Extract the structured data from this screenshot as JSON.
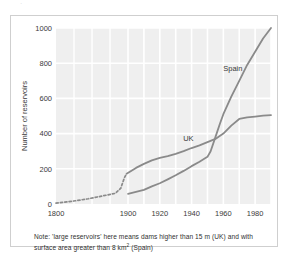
{
  "figure": {
    "scan_artifact": "·",
    "note_prefix": "Note: 'large reservoirs' here means dams higher than 15 m (UK) and with surface area greater than 8 km",
    "note_superscript": "2",
    "note_suffix": " (Spain)",
    "note_full": "Note: 'large reservoirs' here means dams higher than 15 m (UK) and with surface area greater than 8 km2 (Spain)"
  },
  "colors": {
    "panel": "#efefef",
    "gridline": "#ffffff",
    "series_line": "#8a8a8a",
    "frame": "#cfcfcf",
    "text": "#2b2b2b"
  },
  "chart_data": {
    "type": "line",
    "title": "",
    "xlabel": "",
    "ylabel": "Number of reservoirs",
    "xlim": [
      1800,
      1990
    ],
    "ylim": [
      0,
      1000
    ],
    "grid": true,
    "legend": "inline-labels",
    "x_broken_axis": true,
    "x_ticks": [
      1800,
      1900,
      1920,
      1940,
      1960,
      1980
    ],
    "x_tick_labels": [
      "1800",
      "1900",
      "1920",
      "1940",
      "1960",
      "1980"
    ],
    "y_ticks": [
      0,
      200,
      400,
      600,
      800,
      1000
    ],
    "y_tick_labels": [
      "0",
      "200",
      "400",
      "600",
      "800",
      "1000"
    ],
    "annotations": [
      {
        "text": "UK",
        "x": 1938,
        "y": 360
      },
      {
        "text": "Spain",
        "x": 1966,
        "y": 755
      }
    ],
    "series": [
      {
        "name": "UK",
        "style": "dashed-then-solid",
        "label": "UK",
        "dashed_points": [
          {
            "x": 1800,
            "y": 5
          },
          {
            "x": 1815,
            "y": 12
          },
          {
            "x": 1830,
            "y": 20
          },
          {
            "x": 1845,
            "y": 30
          },
          {
            "x": 1860,
            "y": 42
          },
          {
            "x": 1872,
            "y": 52
          },
          {
            "x": 1882,
            "y": 60
          },
          {
            "x": 1890,
            "y": 90
          },
          {
            "x": 1895,
            "y": 150
          },
          {
            "x": 1898,
            "y": 172
          }
        ],
        "solid_points": [
          {
            "x": 1898,
            "y": 172
          },
          {
            "x": 1905,
            "y": 205
          },
          {
            "x": 1910,
            "y": 228
          },
          {
            "x": 1915,
            "y": 248
          },
          {
            "x": 1920,
            "y": 262
          },
          {
            "x": 1925,
            "y": 272
          },
          {
            "x": 1930,
            "y": 285
          },
          {
            "x": 1935,
            "y": 300
          },
          {
            "x": 1940,
            "y": 318
          },
          {
            "x": 1945,
            "y": 333
          },
          {
            "x": 1950,
            "y": 352
          },
          {
            "x": 1955,
            "y": 370
          },
          {
            "x": 1960,
            "y": 400
          },
          {
            "x": 1965,
            "y": 445
          },
          {
            "x": 1970,
            "y": 483
          },
          {
            "x": 1975,
            "y": 492
          },
          {
            "x": 1980,
            "y": 497
          },
          {
            "x": 1985,
            "y": 502
          },
          {
            "x": 1990,
            "y": 505
          }
        ]
      },
      {
        "name": "Spain",
        "style": "solid",
        "label": "Spain",
        "solid_points": [
          {
            "x": 1900,
            "y": 58
          },
          {
            "x": 1910,
            "y": 80
          },
          {
            "x": 1915,
            "y": 100
          },
          {
            "x": 1920,
            "y": 118
          },
          {
            "x": 1925,
            "y": 140
          },
          {
            "x": 1930,
            "y": 163
          },
          {
            "x": 1935,
            "y": 188
          },
          {
            "x": 1940,
            "y": 215
          },
          {
            "x": 1945,
            "y": 240
          },
          {
            "x": 1950,
            "y": 268
          },
          {
            "x": 1952,
            "y": 300
          },
          {
            "x": 1955,
            "y": 380
          },
          {
            "x": 1958,
            "y": 460
          },
          {
            "x": 1960,
            "y": 510
          },
          {
            "x": 1965,
            "y": 610
          },
          {
            "x": 1970,
            "y": 700
          },
          {
            "x": 1975,
            "y": 790
          },
          {
            "x": 1980,
            "y": 865
          },
          {
            "x": 1985,
            "y": 940
          },
          {
            "x": 1990,
            "y": 1000
          }
        ]
      }
    ]
  }
}
